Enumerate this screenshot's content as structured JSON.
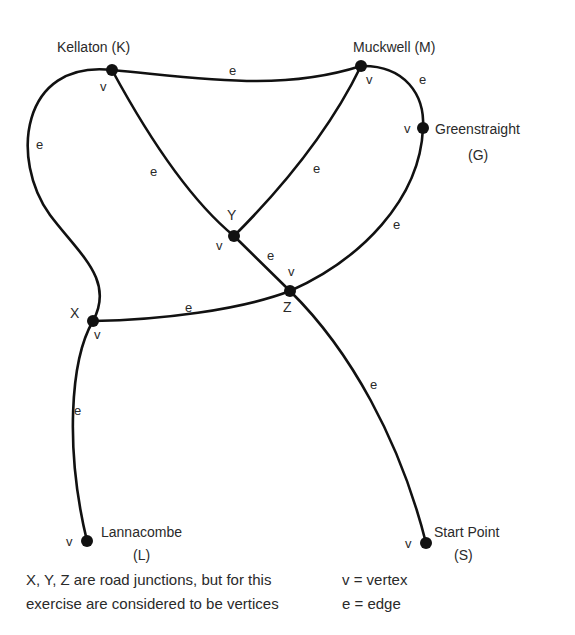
{
  "vertices": {
    "K": {
      "name": "Kellaton (K)",
      "mark": "v"
    },
    "M": {
      "name": "Muckwell (M)",
      "mark": "v"
    },
    "G": {
      "name": "Greenstraight",
      "code": "(G)",
      "mark": "v"
    },
    "Y": {
      "name": "Y",
      "mark": "v"
    },
    "Z": {
      "name": "Z",
      "mark": "v"
    },
    "X": {
      "name": "X",
      "mark": "v"
    },
    "L": {
      "name": "Lannacombe",
      "code": "(L)",
      "mark": "v"
    },
    "S": {
      "name": "Start Point",
      "code": "(S)",
      "mark": "v"
    }
  },
  "edge_mark": "e",
  "edges": [
    {
      "from": "K",
      "to": "M"
    },
    {
      "from": "M",
      "to": "G"
    },
    {
      "from": "K",
      "to": "X"
    },
    {
      "from": "K",
      "to": "Y"
    },
    {
      "from": "M",
      "to": "Y"
    },
    {
      "from": "Y",
      "to": "Z"
    },
    {
      "from": "G",
      "to": "Z"
    },
    {
      "from": "X",
      "to": "Z"
    },
    {
      "from": "X",
      "to": "L"
    },
    {
      "from": "Z",
      "to": "S"
    }
  ],
  "caption": {
    "note_line1": "X, Y, Z are road junctions, but for this",
    "note_line2": "exercise are considered to be vertices",
    "legend_v": "v = vertex",
    "legend_e": "e = edge"
  }
}
